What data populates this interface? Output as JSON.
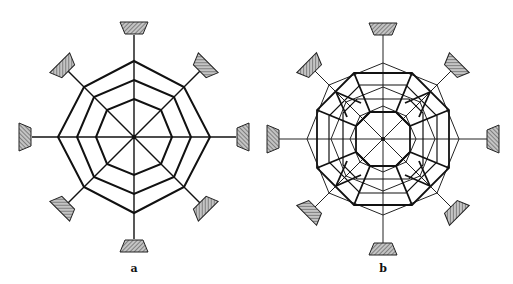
{
  "figure": {
    "panels": [
      {
        "id": "a",
        "label": "a",
        "center": [
          134,
          137
        ],
        "description": "Octagonal web with 8 radial members and 3 concentric octagonal rings, supported at 8 hatched bearings",
        "rings_apothem": [
          30,
          52,
          72
        ],
        "support_count": 8
      },
      {
        "id": "b",
        "label": "b",
        "center": [
          383,
          139
        ],
        "description": "Double-layer octagonal grid: thin diamond-oriented octagons overlaid with thick octagonal rings and diagonal trapezoidal connectors, supported at 8 hatched bearings",
        "thin_rings_radius": [
          30,
          50,
          76
        ],
        "thick_rings_apothem": [
          27,
          64
        ],
        "support_count": 8
      }
    ],
    "colors": {
      "line": "#111111",
      "hatch_fill": "#bdbdbd",
      "hatch_line": "#444444",
      "background": "#ffffff"
    }
  }
}
